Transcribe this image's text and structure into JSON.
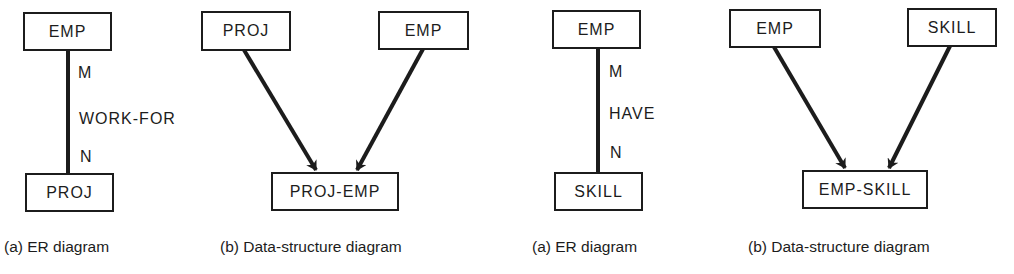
{
  "panels": [
    {
      "id": "er-work-for",
      "type": "ER diagram",
      "caption": "(a)  ER diagram",
      "top_entity": "EMP",
      "bottom_entity": "PROJ",
      "relationship": "WORK-FOR",
      "top_cardinality": "M",
      "bottom_cardinality": "N"
    },
    {
      "id": "ds-proj-emp",
      "type": "Data-structure diagram",
      "caption": "(b)  Data-structure diagram",
      "left_record": "PROJ",
      "right_record": "EMP",
      "link_record": "PROJ-EMP"
    },
    {
      "id": "er-have",
      "type": "ER diagram",
      "caption": "(a)  ER diagram",
      "top_entity": "EMP",
      "bottom_entity": "SKILL",
      "relationship": "HAVE",
      "top_cardinality": "M",
      "bottom_cardinality": "N"
    },
    {
      "id": "ds-emp-skill",
      "type": "Data-structure diagram",
      "caption": "(b)  Data-structure diagram",
      "left_record": "EMP",
      "right_record": "SKILL",
      "link_record": "EMP-SKILL"
    }
  ],
  "colors": {
    "ink": "#1c1c1c",
    "background": "#ffffff"
  }
}
